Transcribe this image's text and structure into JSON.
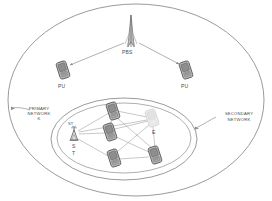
{
  "diagram": {
    "type": "network-topology",
    "colors": {
      "outline": "#8a8a8a",
      "link": "#9a9a9a",
      "device_body": "#b8b8b8",
      "device_edge": "#6e6e6e",
      "device_faint": "#dcdcdc",
      "text": "#4a4a4a",
      "background": "#ffffff"
    },
    "regions": [
      {
        "id": "primary-network",
        "label": "PRIMARY\nNETWORK",
        "shape": "ellipse",
        "cx": 136,
        "cy": 100,
        "rx": 128,
        "ry": 96
      },
      {
        "id": "secondary-network",
        "label": "SECONDARY\nNETWORK",
        "shape": "ellipse",
        "cx": 124,
        "cy": 139,
        "rx": 73,
        "ry": 41
      }
    ],
    "nodes": [
      {
        "id": "pbs",
        "label": "PBS",
        "icon": "antenna-tower-icon",
        "x": 131,
        "y": 33
      },
      {
        "id": "pu-left",
        "label": "PU",
        "icon": "mobile-phone-icon",
        "x": 63,
        "y": 70
      },
      {
        "id": "pu-right",
        "label": "PU",
        "icon": "mobile-phone-icon",
        "x": 186,
        "y": 70
      },
      {
        "id": "st",
        "label": "ST",
        "sublabel_lines": [
          "S",
          "T"
        ],
        "icon": "antenna-tower-small-icon",
        "x": 74,
        "y": 134
      },
      {
        "id": "su-1",
        "label": "",
        "icon": "mobile-phone-icon",
        "x": 113,
        "y": 111
      },
      {
        "id": "su-2",
        "label": "",
        "icon": "mobile-phone-icon",
        "x": 110,
        "y": 132
      },
      {
        "id": "su-3",
        "label": "",
        "icon": "mobile-phone-icon",
        "x": 114,
        "y": 158
      },
      {
        "id": "su-4",
        "label": "",
        "icon": "mobile-phone-icon",
        "x": 155,
        "y": 155
      },
      {
        "id": "eve",
        "label": "E",
        "icon": "eavesdropper-phone-icon",
        "x": 152,
        "y": 120
      }
    ],
    "links": [
      {
        "from": "pbs",
        "to": "pu-left",
        "arrow": true
      },
      {
        "from": "pbs",
        "to": "pu-right",
        "arrow": true
      },
      {
        "from": "st",
        "to": "su-1"
      },
      {
        "from": "st",
        "to": "su-2"
      },
      {
        "from": "st",
        "to": "su-3"
      },
      {
        "from": "st",
        "to": "eve"
      },
      {
        "from": "su-1",
        "to": "su-2"
      },
      {
        "from": "su-1",
        "to": "su-4"
      },
      {
        "from": "su-1",
        "to": "eve"
      },
      {
        "from": "su-2",
        "to": "su-4"
      },
      {
        "from": "su-2",
        "to": "eve"
      },
      {
        "from": "su-3",
        "to": "su-4"
      },
      {
        "from": "su-3",
        "to": "eve"
      },
      {
        "from": "su-4",
        "to": "eve"
      }
    ],
    "annotations": [
      {
        "id": "primary-network-callout",
        "text_line1": "PRIMARY",
        "text_line2": "NETWORK",
        "text_line3": "K",
        "x": 22,
        "y": 110
      },
      {
        "id": "secondary-network-callout",
        "text_line1": "SECONDARY",
        "text_line2": "NETWORK",
        "x": 218,
        "y": 115
      }
    ]
  }
}
